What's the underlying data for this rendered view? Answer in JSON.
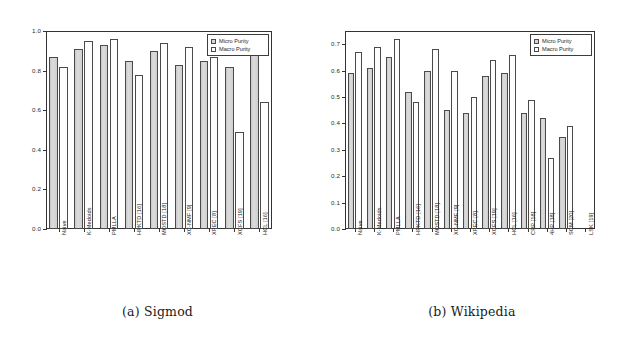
{
  "figure": {
    "panels": [
      {
        "id": "panel-a",
        "caption": "(a) Sigmod",
        "legend": {
          "position": "top-right",
          "items": [
            "Micro Purity",
            "Macro Purity"
          ]
        },
        "chart_data": {
          "type": "bar",
          "title": "(a) Sigmod",
          "xlabel": "",
          "ylabel": "",
          "ylim": [
            0.0,
            1.0
          ],
          "yticks": [
            "0.0",
            "0.2",
            "0.4",
            "0.6",
            "0.8",
            "1.0"
          ],
          "grid": false,
          "legend_position": "top-right",
          "categories": [
            "Naive",
            "K-Medoids",
            "PMLLA",
            "HPKTD [16]",
            "MOSTD [18]",
            "XC-NMF [9]",
            "XPEC [8]",
            "XCFS [19]",
            "HCL [16]"
          ],
          "series": [
            {
              "name": "Micro Purity",
              "values": [
                0.87,
                0.91,
                0.93,
                0.85,
                0.9,
                0.83,
                0.85,
                0.82,
                0.89
              ]
            },
            {
              "name": "Macro Purity",
              "values": [
                0.82,
                0.95,
                0.96,
                0.78,
                0.94,
                0.92,
                0.87,
                0.49,
                0.64
              ]
            }
          ]
        }
      },
      {
        "id": "panel-b",
        "caption": "(b) Wikipedia",
        "legend": {
          "position": "top-right",
          "items": [
            "Micro Purity",
            "Macro Purity"
          ]
        },
        "chart_data": {
          "type": "bar",
          "title": "(b) Wikipedia",
          "xlabel": "",
          "ylabel": "",
          "ylim": [
            0.0,
            0.75
          ],
          "yticks": [
            "0.0",
            "0.1",
            "0.2",
            "0.3",
            "0.4",
            "0.5",
            "0.6",
            "0.7"
          ],
          "grid": false,
          "legend_position": "top-right",
          "categories": [
            "Naive",
            "K-Medoids",
            "PMLLA",
            "HPKTD [16]",
            "MOSTD [18]",
            "XC-NMF [9]",
            "XPEC [8]",
            "XCFS [19]",
            "HCL [16]",
            "CRP [18]",
            "4HP [18]",
            "SCM [20]",
            "LSK [19]"
          ],
          "series": [
            {
              "name": "Micro Purity",
              "values": [
                0.59,
                0.61,
                0.65,
                0.52,
                0.6,
                0.45,
                0.44,
                0.58,
                0.59,
                0.44,
                0.42,
                0.35
              ]
            },
            {
              "name": "Macro Purity",
              "values": [
                0.67,
                0.69,
                0.72,
                0.48,
                0.68,
                0.6,
                0.5,
                0.64,
                0.66,
                0.49,
                0.27,
                0.39
              ]
            }
          ]
        }
      }
    ]
  },
  "colors": {
    "micro_fill": "#d4d4d4",
    "macro_fill": "#fdfdfd",
    "outline": "#4a4a4a",
    "axis": "#333333",
    "text": "#1a1a1a"
  }
}
